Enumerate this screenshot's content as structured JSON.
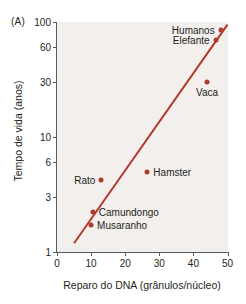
{
  "figure": {
    "panel_label": "(A)",
    "accent_color": "#b03a2e",
    "axis_color": "#58595b",
    "plot_background": "#f2efec"
  },
  "chart_data": {
    "type": "scatter",
    "title": "",
    "xlabel": "Reparo do DNA (grânulos/núcleo)",
    "ylabel": "Tempo de vida (anos)",
    "xlim": [
      0,
      50
    ],
    "ylim": [
      1,
      100
    ],
    "yscale": "log",
    "xscale": "linear",
    "grid": false,
    "legend": false,
    "xticks": [
      0,
      10,
      20,
      30,
      40,
      50
    ],
    "xtick_labels": [
      "0",
      "10",
      "20",
      "30",
      "40",
      "50"
    ],
    "yticks": [
      1,
      3,
      6,
      10,
      30,
      60,
      100
    ],
    "ytick_labels": [
      "1",
      "3",
      "6",
      "10",
      "30",
      "60",
      "100"
    ],
    "points": [
      {
        "label": "Humanos",
        "x": 48.0,
        "y": 85.0,
        "label_pos": "left"
      },
      {
        "label": "Elefante",
        "x": 46.5,
        "y": 70.0,
        "label_pos": "left"
      },
      {
        "label": "Vaca",
        "x": 44.0,
        "y": 30.0,
        "label_pos": "below"
      },
      {
        "label": "Hamster",
        "x": 26.5,
        "y": 4.9,
        "label_pos": "right"
      },
      {
        "label": "Rato",
        "x": 13.0,
        "y": 4.2,
        "label_pos": "left"
      },
      {
        "label": "Camundongo",
        "x": 10.5,
        "y": 2.2,
        "label_pos": "right"
      },
      {
        "label": "Musaranho",
        "x": 10.0,
        "y": 1.7,
        "label_pos": "right"
      }
    ],
    "trendline": {
      "type": "linear-fit-on-log-y",
      "x_start": 5.0,
      "y_start": 1.18,
      "x_end": 50.0,
      "y_end": 95.0,
      "color": "#b03a2e"
    }
  }
}
